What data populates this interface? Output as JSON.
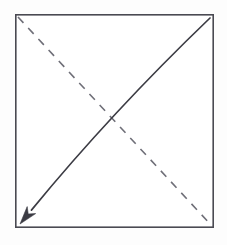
{
  "figure": {
    "canvas": {
      "width": 227,
      "height": 245,
      "background": "#fdfdfd"
    },
    "square": {
      "name": "square-outline",
      "x": 15,
      "y": 14,
      "width": 199,
      "height": 214,
      "stroke": "#4a4a52",
      "stroke_width": 1.6,
      "fill": "#ffffff"
    },
    "dashed_diagonal": {
      "name": "dashed-diagonal",
      "from": {
        "x": 18,
        "y": 17
      },
      "to": {
        "x": 212,
        "y": 226
      },
      "stroke": "#6f6f78",
      "stroke_width": 1.6,
      "dash_pattern": "8 7",
      "direction": "top-left-to-bottom-right"
    },
    "arrow_diagonal": {
      "name": "arrow-diagonal",
      "from": {
        "x": 210,
        "y": 18
      },
      "control": {
        "x": 112,
        "y": 112
      },
      "to": {
        "x": 25,
        "y": 219
      },
      "stroke": "#3c3c44",
      "stroke_width": 1.7,
      "direction": "top-right-to-bottom-left",
      "arrowhead": {
        "name": "arrowhead",
        "tip": {
          "x": 20,
          "y": 224
        },
        "fill": "#3c3c44",
        "length": 18,
        "width": 11
      }
    },
    "intersection": {
      "x": 115,
      "y": 117
    }
  }
}
